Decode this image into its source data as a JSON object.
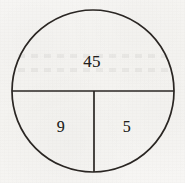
{
  "figure": {
    "name": "circle-partition-diagram",
    "type": "diagram",
    "background_color": "#f6f5f3",
    "stroke_color": "#2a2623",
    "text_color": "#231f1c",
    "circle": {
      "center_x": 93,
      "center_y": 91,
      "radius": 81
    },
    "dividers": [
      {
        "name": "horizontal-diameter",
        "orientation": "horizontal",
        "x1": 12,
        "y1": 91,
        "x2": 174,
        "y2": 91
      },
      {
        "name": "vertical-radius",
        "orientation": "vertical",
        "x1": 94,
        "y1": 91,
        "x2": 94,
        "y2": 172
      }
    ],
    "regions": [
      {
        "id": "top",
        "label": "45",
        "position": "upper half",
        "cx": 92,
        "cy": 62
      },
      {
        "id": "bottom-left",
        "label": "9",
        "position": "lower left quarter",
        "cx": 61,
        "cy": 127
      },
      {
        "id": "bottom-right",
        "label": "5",
        "position": "lower right quarter",
        "cx": 127,
        "cy": 127
      }
    ]
  }
}
